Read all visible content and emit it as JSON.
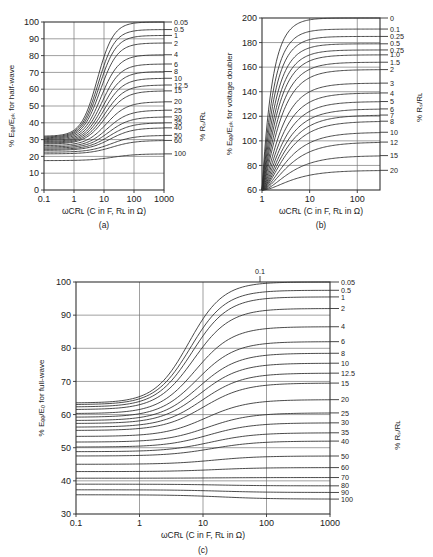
{
  "page": {
    "background": "#ffffff"
  },
  "chart_data": [
    {
      "id": "a",
      "type": "line",
      "panel_label": "(a)",
      "title": "",
      "xlabel": "ωCRʟ (C in F, Rʟ in Ω)",
      "ylabel": "% Eₑₑ/Eₚₖ for half‑wave",
      "right_axis_label": "% Rₛ/Rʟ",
      "xscale": "log",
      "xlim": [
        0.1,
        1000
      ],
      "xticks": [
        0.1,
        1,
        10,
        100,
        1000
      ],
      "xticklabels": [
        "0.1",
        "1",
        "10",
        "100",
        "1000"
      ],
      "ylim": [
        0,
        100
      ],
      "yticks": [
        0,
        10,
        20,
        30,
        40,
        50,
        60,
        70,
        80,
        90,
        100
      ],
      "yticklabels": [
        "0",
        "10",
        "20",
        "30",
        "40",
        "50",
        "60",
        "70",
        "80",
        "90",
        "100"
      ],
      "grid": true,
      "series": [
        {
          "name": "0.05",
          "plateau_right": 100,
          "plateau_left": 32.0
        },
        {
          "name": "0.5",
          "plateau_right": 95.5,
          "plateau_left": 31.5
        },
        {
          "name": "1",
          "plateau_right": 92.0,
          "plateau_left": 31.0
        },
        {
          "name": "2",
          "plateau_right": 87.5,
          "plateau_left": 30.5
        },
        {
          "name": "4",
          "plateau_right": 80.5,
          "plateau_left": 30.0
        },
        {
          "name": "6",
          "plateau_right": 75.0,
          "plateau_left": 29.4
        },
        {
          "name": "8",
          "plateau_right": 70.5,
          "plateau_left": 28.8
        },
        {
          "name": "10",
          "plateau_right": 66.5,
          "plateau_left": 28.3
        },
        {
          "name": "12.5",
          "plateau_right": 62.5,
          "plateau_left": 27.8
        },
        {
          "name": "15",
          "plateau_right": 59.0,
          "plateau_left": 27.3
        },
        {
          "name": "20",
          "plateau_right": 52.5,
          "plateau_left": 26.4
        },
        {
          "name": "25",
          "plateau_right": 47.5,
          "plateau_left": 25.6
        },
        {
          "name": "30",
          "plateau_right": 43.5,
          "plateau_left": 24.9
        },
        {
          "name": "35",
          "plateau_right": 40.0,
          "plateau_left": 24.2
        },
        {
          "name": "40",
          "plateau_right": 37.0,
          "plateau_left": 23.6
        },
        {
          "name": "50",
          "plateau_right": 32.5,
          "plateau_left": 22.5
        },
        {
          "name": "60",
          "plateau_right": 29.5,
          "plateau_left": 21.5
        },
        {
          "name": "100",
          "plateau_right": 21.5,
          "plateau_left": 17.5
        }
      ]
    },
    {
      "id": "b",
      "type": "line",
      "panel_label": "(b)",
      "title": "",
      "xlabel": "ωCRʟ (C in F, Rʟ in Ω)",
      "ylabel": "% Eₑₑ/Eₚₖ for voltage doubler",
      "right_axis_label": "% Rₛ/Rʟ",
      "xscale": "log",
      "xlim": [
        1,
        300
      ],
      "xticks": [
        1,
        10,
        100
      ],
      "xticklabels": [
        "1",
        "10",
        "100"
      ],
      "ylim": [
        60,
        200
      ],
      "yticks": [
        60,
        80,
        100,
        120,
        140,
        160,
        180,
        200
      ],
      "yticklabels": [
        "60",
        "80",
        "100",
        "120",
        "140",
        "160",
        "180",
        "200"
      ],
      "grid": true,
      "series": [
        {
          "name": "0",
          "plateau_right": 200
        },
        {
          "name": "0.1",
          "plateau_right": 191
        },
        {
          "name": "0.25",
          "plateau_right": 185
        },
        {
          "name": "0.5",
          "plateau_right": 179
        },
        {
          "name": "0.75",
          "plateau_right": 174
        },
        {
          "name": "1.0",
          "plateau_right": 170
        },
        {
          "name": "1.5",
          "plateau_right": 164
        },
        {
          "name": "2",
          "plateau_right": 158
        },
        {
          "name": "3",
          "plateau_right": 147
        },
        {
          "name": "4",
          "plateau_right": 139
        },
        {
          "name": "5",
          "plateau_right": 132
        },
        {
          "name": "6",
          "plateau_right": 126
        },
        {
          "name": "7",
          "plateau_right": 121
        },
        {
          "name": "8",
          "plateau_right": 116
        },
        {
          "name": "10",
          "plateau_right": 107
        },
        {
          "name": "12",
          "plateau_right": 99
        },
        {
          "name": "15",
          "plateau_right": 88
        },
        {
          "name": "20",
          "plateau_right": 76
        }
      ]
    },
    {
      "id": "c",
      "type": "line",
      "panel_label": "(c)",
      "title": "",
      "xlabel": "ωCRʟ (C in F, Rʟ in Ω)",
      "ylabel": "% Eₑₑ/E₀ for full‑wave",
      "right_axis_label": "% Rₛ/Rʟ",
      "top_annotation": "0.1",
      "xscale": "log",
      "xlim": [
        0.1,
        1000
      ],
      "xticks": [
        0.1,
        1,
        10,
        100,
        1000
      ],
      "xticklabels": [
        "0.1",
        "1",
        "10",
        "100",
        "1000"
      ],
      "ylim": [
        30,
        100
      ],
      "yticks": [
        30,
        40,
        50,
        60,
        70,
        80,
        90,
        100
      ],
      "yticklabels": [
        "30",
        "40",
        "50",
        "60",
        "70",
        "80",
        "90",
        "100"
      ],
      "grid": true,
      "series": [
        {
          "name": "0.05",
          "plateau_right": 100.0,
          "plateau_left": 63.5
        },
        {
          "name": "0.5",
          "plateau_right": 97.5,
          "plateau_left": 63.0
        },
        {
          "name": "1",
          "plateau_right": 95.5,
          "plateau_left": 62.3
        },
        {
          "name": "2",
          "plateau_right": 92.0,
          "plateau_left": 61.5
        },
        {
          "name": "4",
          "plateau_right": 86.5,
          "plateau_left": 60.3
        },
        {
          "name": "6",
          "plateau_right": 82.0,
          "plateau_left": 59.2
        },
        {
          "name": "8",
          "plateau_right": 78.5,
          "plateau_left": 58.2
        },
        {
          "name": "10",
          "plateau_right": 75.5,
          "plateau_left": 57.3
        },
        {
          "name": "12.5",
          "plateau_right": 72.5,
          "plateau_left": 56.2
        },
        {
          "name": "15",
          "plateau_right": 69.5,
          "plateau_left": 55.2
        },
        {
          "name": "20",
          "plateau_right": 64.5,
          "plateau_left": 53.4
        },
        {
          "name": "25",
          "plateau_right": 60.5,
          "plateau_left": 51.7
        },
        {
          "name": "30",
          "plateau_right": 57.5,
          "plateau_left": 50.2
        },
        {
          "name": "35",
          "plateau_right": 54.5,
          "plateau_left": 48.8
        },
        {
          "name": "40",
          "plateau_right": 52.0,
          "plateau_left": 47.5
        },
        {
          "name": "50",
          "plateau_right": 47.5,
          "plateau_left": 45.0
        },
        {
          "name": "60",
          "plateau_right": 44.0,
          "plateau_left": 42.8
        },
        {
          "name": "70",
          "plateau_right": 41.0,
          "plateau_left": 40.8
        },
        {
          "name": "80",
          "plateau_right": 38.5,
          "plateau_left": 39.0
        },
        {
          "name": "90",
          "plateau_right": 36.5,
          "plateau_left": 37.3
        },
        {
          "name": "100",
          "plateau_right": 34.5,
          "plateau_left": 35.8
        }
      ]
    }
  ]
}
